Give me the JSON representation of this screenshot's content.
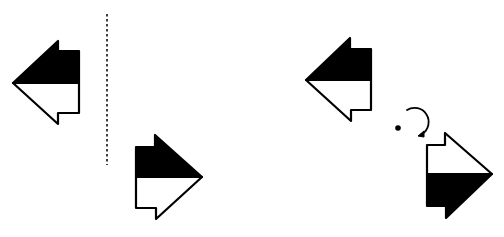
{
  "diagram": {
    "type": "geometric-transformations",
    "background": "#ffffff",
    "stroke_color": "#000000",
    "fill_color": "#000000",
    "panels": [
      {
        "name": "reflection",
        "description": "Arrow shape reflected across a vertical dashed mirror line",
        "mirror_line": {
          "x": 107,
          "y1": 14,
          "y2": 165,
          "style": "dashed"
        },
        "shapes": [
          {
            "name": "original-arrow",
            "direction": "left",
            "filled_half": "top"
          },
          {
            "name": "reflected-arrow",
            "direction": "right",
            "filled_half": "top"
          }
        ]
      },
      {
        "name": "rotation",
        "description": "Arrow shape rotated 180 degrees about a center point",
        "center_point": {
          "x": 398,
          "y": 128
        },
        "rotation_indicator": "clockwise-arc",
        "shapes": [
          {
            "name": "original-arrow",
            "direction": "left",
            "filled_half": "top"
          },
          {
            "name": "rotated-arrow",
            "direction": "right",
            "filled_half": "bottom"
          }
        ]
      }
    ]
  }
}
